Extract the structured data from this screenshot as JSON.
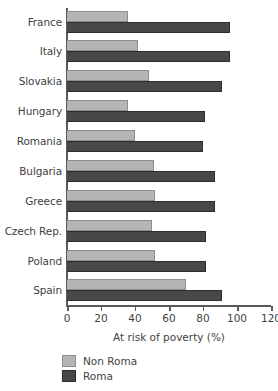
{
  "chart_data": {
    "type": "bar",
    "orientation": "horizontal",
    "title": "",
    "xlabel": "At risk of poverty (%)",
    "ylabel": "",
    "xlim": [
      0,
      120
    ],
    "xticks": [
      0,
      20,
      40,
      60,
      80,
      100,
      120
    ],
    "xtick_labels": [
      "0",
      "20",
      "40",
      "60",
      "80",
      "100",
      "120"
    ],
    "grid": false,
    "legend_position": "bottom-left",
    "categories": [
      "France",
      "Italy",
      "Slovakia",
      "Hungary",
      "Romania",
      "Bulgaria",
      "Greece",
      "Czech Rep.",
      "Poland",
      "Spain"
    ],
    "series": [
      {
        "name": "Non Roma",
        "color": "#b5b5b5",
        "values": [
          36,
          42,
          48,
          36,
          40,
          51,
          52,
          50,
          52,
          70
        ]
      },
      {
        "name": "Roma",
        "color": "#484848",
        "values": [
          96,
          96,
          91,
          81,
          80,
          87,
          87,
          82,
          82,
          91
        ]
      }
    ]
  }
}
